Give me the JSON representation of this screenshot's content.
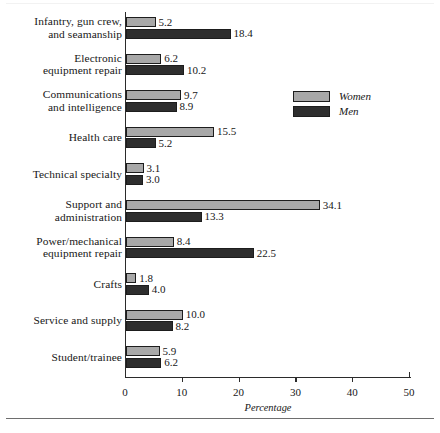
{
  "chart_data": {
    "type": "bar",
    "orientation": "horizontal",
    "title": "",
    "xlabel": "Percentage",
    "ylabel": "",
    "xlim": [
      0,
      50
    ],
    "xticks": [
      0,
      10,
      20,
      30,
      40,
      50
    ],
    "grid": false,
    "legend_position": "upper-right",
    "categories": [
      "Infantry, gun crew, and seamanship",
      "Electronic equipment repair",
      "Communications and intelligence",
      "Health care",
      "Technical specialty",
      "Support and administration",
      "Power/mechanical equipment repair",
      "Crafts",
      "Service and supply",
      "Student/trainee"
    ],
    "category_lines": [
      [
        "Infantry, gun crew,",
        "and seamanship"
      ],
      [
        "Electronic",
        "equipment repair"
      ],
      [
        "Communications",
        "and intelligence"
      ],
      [
        "Health care"
      ],
      [
        "Technical specialty"
      ],
      [
        "Support and",
        "administration"
      ],
      [
        "Power/mechanical",
        "equipment repair"
      ],
      [
        "Crafts"
      ],
      [
        "Service and supply"
      ],
      [
        "Student/trainee"
      ]
    ],
    "series": [
      {
        "name": "Women",
        "color": "#a8a8a8",
        "values": [
          5.2,
          6.2,
          9.7,
          15.5,
          3.1,
          34.1,
          8.4,
          1.8,
          10.0,
          5.9
        ],
        "labels": [
          "5.2",
          "6.2",
          "9.7",
          "15.5",
          "3.1",
          "34.1",
          "8.4",
          "1.8",
          "10.0",
          "5.9"
        ]
      },
      {
        "name": "Men",
        "color": "#2e2e2e",
        "values": [
          18.4,
          10.2,
          8.9,
          5.2,
          3.0,
          13.3,
          22.5,
          4.0,
          8.2,
          6.2
        ],
        "labels": [
          "18.4",
          "10.2",
          "8.9",
          "5.2",
          "3.0",
          "13.3",
          "22.5",
          "4.0",
          "8.2",
          "6.2"
        ]
      }
    ]
  },
  "legend": {
    "items": [
      {
        "label": "Women",
        "color": "#a8a8a8"
      },
      {
        "label": "Men",
        "color": "#2e2e2e"
      }
    ]
  },
  "axis": {
    "x_title": "Percentage",
    "tick_labels": [
      "0",
      "10",
      "20",
      "30",
      "40",
      "50"
    ]
  }
}
